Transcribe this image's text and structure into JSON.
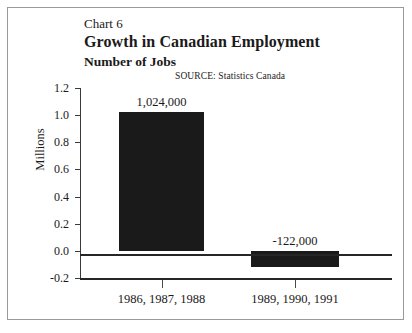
{
  "chart_data": {
    "type": "bar",
    "title": "Growth in Canadian Employment",
    "subtitle": "Number of Jobs",
    "chart_number": "Chart 6",
    "source": "SOURCE:  Statistics Canada",
    "categories": [
      "1986, 1987, 1988",
      "1989, 1990, 1991"
    ],
    "values": [
      1.024,
      -0.122
    ],
    "value_labels": [
      "1,024,000",
      "-122,000"
    ],
    "xlabel": "",
    "ylabel": "Millions",
    "ylim": [
      -0.2,
      1.2
    ],
    "yticks": [
      "1.2",
      "1.0",
      "0.8",
      "0.6",
      "0.4",
      "0.2",
      "0.0",
      "-0.2"
    ],
    "grid": false,
    "legend": false,
    "bar_color": "#1a1a1a",
    "axis_color": "#262626",
    "background": "#ffffff"
  }
}
